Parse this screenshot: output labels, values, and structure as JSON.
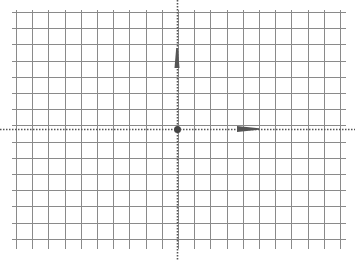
{
  "diagram": {
    "background": "#ffffff",
    "grid": {
      "color": "#8a8a8a",
      "x_start": 16,
      "x_end": 346,
      "y_start": 12,
      "y_end": 247,
      "spacing": 16.2,
      "columns": 21,
      "rows": 15
    },
    "axes": {
      "color": "#555555",
      "style": "dotted",
      "origin": {
        "x": 177,
        "y": 129
      }
    },
    "origin_point": {
      "label": "origin",
      "color": "#444444",
      "radius": 3.5
    },
    "vectors": [
      {
        "name": "y-axis-arrow",
        "direction": "up",
        "from": [
          177,
          68
        ],
        "to": [
          177,
          48
        ],
        "color": "#555555"
      },
      {
        "name": "x-axis-arrow",
        "direction": "right",
        "from": [
          237,
          129
        ],
        "to": [
          259,
          129
        ],
        "color": "#555555"
      }
    ]
  }
}
